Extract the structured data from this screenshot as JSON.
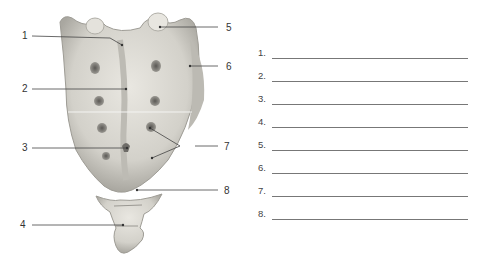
{
  "figure": {
    "callouts": [
      {
        "num": "1",
        "side": "left"
      },
      {
        "num": "2",
        "side": "left"
      },
      {
        "num": "3",
        "side": "left"
      },
      {
        "num": "4",
        "side": "left"
      },
      {
        "num": "5",
        "side": "right"
      },
      {
        "num": "6",
        "side": "right"
      },
      {
        "num": "7",
        "side": "right"
      },
      {
        "num": "8",
        "side": "right"
      }
    ]
  },
  "answers": {
    "rows": [
      {
        "label": "1.",
        "value": ""
      },
      {
        "label": "2.",
        "value": ""
      },
      {
        "label": "3.",
        "value": ""
      },
      {
        "label": "4.",
        "value": ""
      },
      {
        "label": "5.",
        "value": ""
      },
      {
        "label": "6.",
        "value": ""
      },
      {
        "label": "7.",
        "value": ""
      },
      {
        "label": "8.",
        "value": ""
      }
    ]
  },
  "colors": {
    "bone": "#d8d6cf",
    "bone_shadow": "#a8a69f",
    "leader_line": "#444444",
    "answer_line": "#777777"
  }
}
